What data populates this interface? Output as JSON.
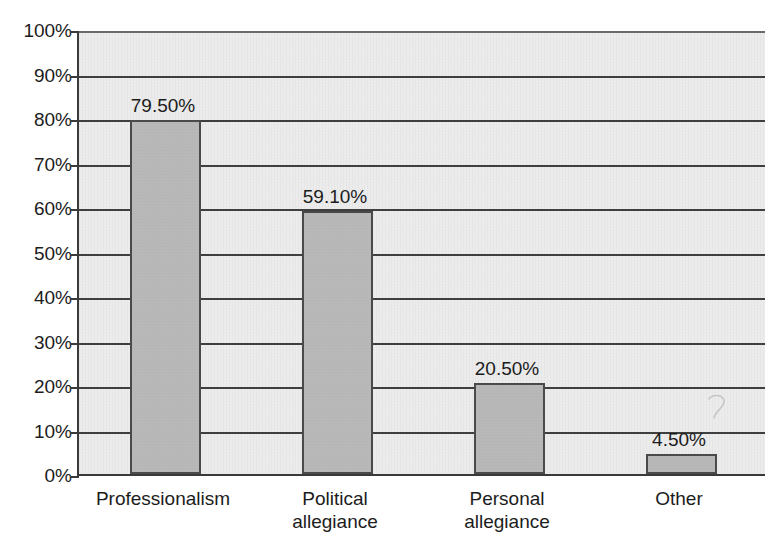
{
  "chart_data": {
    "type": "bar",
    "title": "",
    "subtitle": "",
    "xlabel": "",
    "ylabel": "",
    "categories": [
      "Professionalism",
      "Political\nallegiance",
      "Personal\nallegiance",
      "Other"
    ],
    "values": [
      79.5,
      59.1,
      20.5,
      4.5
    ],
    "data_labels": [
      "79.50%",
      "59.10%",
      "20.50%",
      "4.50%"
    ],
    "ylim": [
      0,
      100
    ],
    "ytick_values": [
      0,
      10,
      20,
      30,
      40,
      50,
      60,
      70,
      80,
      90,
      100
    ],
    "ytick_labels": [
      "0%",
      "10%",
      "20%",
      "30%",
      "40%",
      "50%",
      "60%",
      "70%",
      "80%",
      "90%",
      "100%"
    ],
    "grid": true,
    "grid_axis": "y",
    "legend": false,
    "legend_position": "none",
    "series": [
      {
        "name": "",
        "values": [
          79.5,
          59.1,
          20.5,
          4.5
        ]
      }
    ]
  },
  "style": {
    "plot_background": "#ececec",
    "page_background": "#ffffff",
    "bar_fill": "#b9b9b9",
    "bar_border": "#4a4a4a",
    "gridline_color": "#3f3f3f",
    "axis_color": "#3a3a3a",
    "text_color": "#1c1c1c"
  },
  "artifacts": {
    "scan_mark_label": "faint-pencil-mark"
  }
}
